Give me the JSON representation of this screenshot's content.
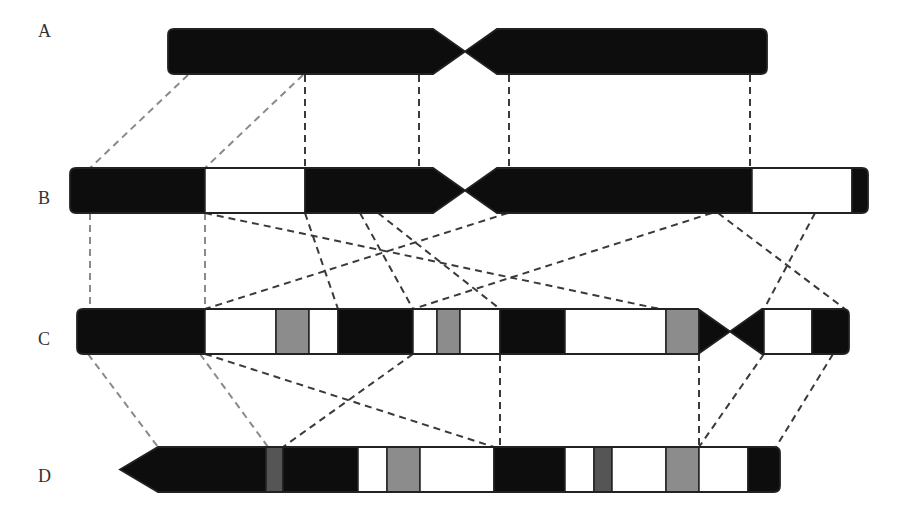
{
  "figure": {
    "type": "chromosome-rearrangement-diagram",
    "rows": [
      {
        "label": "A",
        "label_x": 38,
        "label_y": 33
      },
      {
        "label": "B",
        "label_x": 38,
        "label_y": 200
      },
      {
        "label": "C",
        "label_x": 38,
        "label_y": 341
      },
      {
        "label": "D",
        "label_x": 38,
        "label_y": 478
      }
    ],
    "colors": {
      "black_band": "#0d0d0d",
      "white_band": "#ffffff",
      "gray_band": "#8c8c8c",
      "dark_gray_band": "#555555",
      "outline": "#222222",
      "line_light": "#8a8a8a",
      "line_dark": "#3a3a3a"
    },
    "chromosomes": {
      "A": {
        "y": 29,
        "h": 45,
        "left_arm": {
          "x1": 168,
          "x2": 460
        },
        "centromere_x": 465,
        "right_arm": {
          "x1": 470,
          "x2": 767
        },
        "bands": [
          {
            "x1": 168,
            "x2": 767,
            "fill": "black"
          }
        ]
      },
      "B": {
        "y": 168,
        "h": 45,
        "centromere_x": 465,
        "bands": [
          {
            "x1": 70,
            "x2": 205,
            "fill": "black"
          },
          {
            "x1": 205,
            "x2": 305,
            "fill": "white"
          },
          {
            "x1": 305,
            "x2": 752,
            "fill": "black"
          },
          {
            "x1": 752,
            "x2": 852,
            "fill": "white"
          },
          {
            "x1": 852,
            "x2": 868,
            "fill": "black"
          }
        ]
      },
      "C": {
        "y": 309,
        "h": 45,
        "centromere_x": 730,
        "bands": [
          {
            "x1": 77,
            "x2": 205,
            "fill": "black"
          },
          {
            "x1": 205,
            "x2": 276,
            "fill": "white"
          },
          {
            "x1": 276,
            "x2": 309,
            "fill": "gray"
          },
          {
            "x1": 309,
            "x2": 338,
            "fill": "white"
          },
          {
            "x1": 338,
            "x2": 413,
            "fill": "black"
          },
          {
            "x1": 413,
            "x2": 437,
            "fill": "white"
          },
          {
            "x1": 437,
            "x2": 460,
            "fill": "gray"
          },
          {
            "x1": 460,
            "x2": 500,
            "fill": "white"
          },
          {
            "x1": 500,
            "x2": 565,
            "fill": "black"
          },
          {
            "x1": 565,
            "x2": 666,
            "fill": "white"
          },
          {
            "x1": 666,
            "x2": 699,
            "fill": "gray"
          },
          {
            "x1": 699,
            "x2": 764,
            "fill": "black"
          },
          {
            "x1": 764,
            "x2": 812,
            "fill": "white"
          },
          {
            "x1": 812,
            "x2": 849,
            "fill": "black"
          }
        ]
      },
      "D": {
        "y": 447,
        "h": 45,
        "bands": [
          {
            "x1": 120,
            "x2": 266,
            "fill": "black"
          },
          {
            "x1": 266,
            "x2": 283,
            "fill": "darkgray"
          },
          {
            "x1": 283,
            "x2": 358,
            "fill": "black"
          },
          {
            "x1": 358,
            "x2": 387,
            "fill": "white"
          },
          {
            "x1": 387,
            "x2": 420,
            "fill": "gray"
          },
          {
            "x1": 420,
            "x2": 494,
            "fill": "white"
          },
          {
            "x1": 494,
            "x2": 565,
            "fill": "black"
          },
          {
            "x1": 565,
            "x2": 594,
            "fill": "white"
          },
          {
            "x1": 594,
            "x2": 612,
            "fill": "darkgray"
          },
          {
            "x1": 612,
            "x2": 666,
            "fill": "white"
          },
          {
            "x1": 666,
            "x2": 699,
            "fill": "gray"
          },
          {
            "x1": 699,
            "x2": 748,
            "fill": "white"
          },
          {
            "x1": 748,
            "x2": 780,
            "fill": "black"
          }
        ]
      }
    },
    "connectors": {
      "A_to_B": [
        {
          "x1": 188,
          "y1": 75,
          "x2": 90,
          "y2": 168,
          "tone": "light"
        },
        {
          "x1": 303,
          "y1": 75,
          "x2": 205,
          "y2": 168,
          "tone": "light"
        },
        {
          "x1": 305,
          "y1": 75,
          "x2": 305,
          "y2": 168,
          "tone": "dark"
        },
        {
          "x1": 419,
          "y1": 75,
          "x2": 419,
          "y2": 168,
          "tone": "dark"
        },
        {
          "x1": 509,
          "y1": 75,
          "x2": 509,
          "y2": 168,
          "tone": "dark"
        },
        {
          "x1": 750,
          "y1": 75,
          "x2": 750,
          "y2": 168,
          "tone": "dark"
        }
      ],
      "B_to_C": [
        {
          "x1": 90,
          "y1": 213,
          "x2": 90,
          "y2": 309,
          "tone": "light"
        },
        {
          "x1": 205,
          "y1": 213,
          "x2": 205,
          "y2": 309,
          "tone": "light"
        },
        {
          "x1": 205,
          "y1": 213,
          "x2": 660,
          "y2": 309,
          "tone": "dark"
        },
        {
          "x1": 305,
          "y1": 213,
          "x2": 338,
          "y2": 309,
          "tone": "dark"
        },
        {
          "x1": 360,
          "y1": 213,
          "x2": 413,
          "y2": 309,
          "tone": "dark"
        },
        {
          "x1": 378,
          "y1": 213,
          "x2": 500,
          "y2": 309,
          "tone": "dark"
        },
        {
          "x1": 508,
          "y1": 213,
          "x2": 205,
          "y2": 309,
          "tone": "dark"
        },
        {
          "x1": 712,
          "y1": 213,
          "x2": 413,
          "y2": 309,
          "tone": "dark"
        },
        {
          "x1": 718,
          "y1": 213,
          "x2": 845,
          "y2": 309,
          "tone": "dark"
        },
        {
          "x1": 815,
          "y1": 213,
          "x2": 764,
          "y2": 309,
          "tone": "dark"
        }
      ],
      "C_to_D": [
        {
          "x1": 88,
          "y1": 354,
          "x2": 158,
          "y2": 447,
          "tone": "light"
        },
        {
          "x1": 200,
          "y1": 354,
          "x2": 268,
          "y2": 447,
          "tone": "light"
        },
        {
          "x1": 205,
          "y1": 354,
          "x2": 494,
          "y2": 447,
          "tone": "dark"
        },
        {
          "x1": 413,
          "y1": 354,
          "x2": 283,
          "y2": 447,
          "tone": "dark"
        },
        {
          "x1": 500,
          "y1": 354,
          "x2": 500,
          "y2": 447,
          "tone": "dark"
        },
        {
          "x1": 699,
          "y1": 354,
          "x2": 699,
          "y2": 447,
          "tone": "dark"
        },
        {
          "x1": 764,
          "y1": 354,
          "x2": 699,
          "y2": 447,
          "tone": "dark"
        },
        {
          "x1": 833,
          "y1": 354,
          "x2": 776,
          "y2": 447,
          "tone": "dark"
        }
      ]
    }
  }
}
